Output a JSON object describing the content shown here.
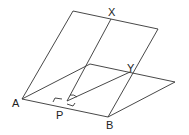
{
  "diagram": {
    "labels": {
      "X": "X",
      "Y": "Y",
      "A": "A",
      "P": "P",
      "B": "B"
    },
    "line_color": "#333333"
  }
}
